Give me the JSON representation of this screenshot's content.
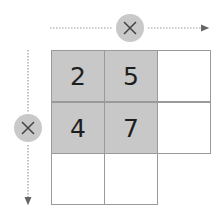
{
  "diagram": {
    "operator_top": "×",
    "operator_left": "×",
    "grid": {
      "rows": [
        [
          {
            "value": "2",
            "shaded": true
          },
          {
            "value": "5",
            "shaded": true
          },
          {
            "value": "",
            "shaded": false
          }
        ],
        [
          {
            "value": "4",
            "shaded": true
          },
          {
            "value": "7",
            "shaded": true
          },
          {
            "value": "",
            "shaded": false
          }
        ],
        [
          {
            "value": "",
            "shaded": false
          },
          {
            "value": "",
            "shaded": false
          }
        ]
      ]
    },
    "colors": {
      "shaded": "#c8c8c8",
      "border": "#9a9a9a",
      "operator_bg": "#c9c9c9",
      "arrow": "#888888"
    }
  }
}
